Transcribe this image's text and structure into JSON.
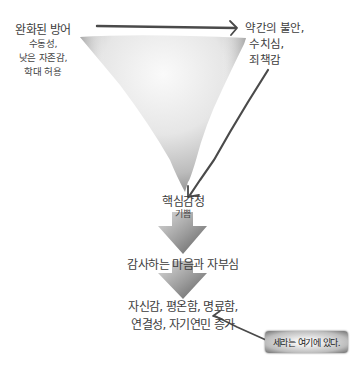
{
  "diagram": {
    "top_left": {
      "title": "완화된 방어",
      "details": [
        "수동성,",
        "낮은 자존감,",
        "학대 허용"
      ]
    },
    "top_right": {
      "lines": [
        "약간의 불안,",
        "수치심,",
        "죄책감"
      ]
    },
    "core": {
      "title": "핵심감정",
      "detail": "기쁨"
    },
    "step2": {
      "label": "감사하는 마음과 자부심"
    },
    "step3": {
      "lines": [
        "자신감, 평온함, 명료함,",
        "연결성, 자기연민 증가"
      ]
    },
    "callout": {
      "label": "세라는 여기에 있다."
    }
  },
  "colors": {
    "triangle_light": "#f7f7f7",
    "triangle_dark": "#6e6e6e",
    "arrow_line": "#4a4a4a",
    "block_arrow_light": "#d8d8d8",
    "block_arrow_dark": "#6a6a6a"
  }
}
